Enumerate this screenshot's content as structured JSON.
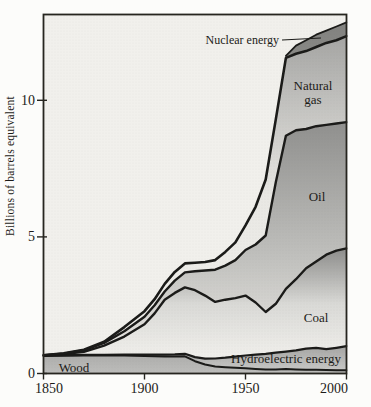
{
  "figure": {
    "background": "#fcfcfa",
    "plot_background": "#f1f0ec",
    "line_color": "#1b1b19"
  },
  "chart_data": {
    "type": "area",
    "stacked": true,
    "title": "",
    "xlabel": "",
    "ylabel": "Billions of barrels equivalent",
    "xlim": [
      1850,
      2000
    ],
    "ylim": [
      0,
      13.14
    ],
    "x_ticks": [
      1850,
      1900,
      1950,
      2000
    ],
    "y_ticks": [
      0,
      5,
      10
    ],
    "grid": false,
    "legend_position": "labels-inside-areas",
    "x": [
      1850,
      1860,
      1870,
      1880,
      1890,
      1900,
      1905,
      1910,
      1915,
      1920,
      1925,
      1930,
      1935,
      1940,
      1945,
      1950,
      1955,
      1960,
      1965,
      1970,
      1975,
      1980,
      1985,
      1990,
      1995,
      2000
    ],
    "series": [
      {
        "name": "wood",
        "label": "Wood",
        "values": [
          0.64,
          0.65,
          0.66,
          0.66,
          0.66,
          0.64,
          0.63,
          0.62,
          0.62,
          0.63,
          0.45,
          0.33,
          0.26,
          0.23,
          0.21,
          0.19,
          0.17,
          0.15,
          0.15,
          0.16,
          0.15,
          0.14,
          0.14,
          0.13,
          0.12,
          0.12
        ],
        "gradient": [
          [
            0,
            "#aeaeac"
          ],
          [
            1,
            "#bdbdbb"
          ]
        ],
        "label_pos": [
          74,
          372
        ],
        "line_width": 2.0
      },
      {
        "name": "hydroelectric",
        "label": "Hydroelectric energy",
        "values": [
          0.02,
          0.02,
          0.02,
          0.02,
          0.03,
          0.05,
          0.06,
          0.07,
          0.08,
          0.09,
          0.15,
          0.21,
          0.29,
          0.35,
          0.41,
          0.47,
          0.52,
          0.57,
          0.61,
          0.64,
          0.7,
          0.77,
          0.8,
          0.76,
          0.82,
          0.88
        ],
        "gradient": [
          [
            0,
            "#a5a5a3"
          ],
          [
            1,
            "#c8c8c6"
          ]
        ],
        "label_pos": [
          286,
          363
        ],
        "line_width": 2.2
      },
      {
        "name": "coal",
        "label": "Coal",
        "values": [
          0.0,
          0.04,
          0.11,
          0.34,
          0.66,
          1.11,
          1.51,
          2.01,
          2.25,
          2.43,
          2.45,
          2.31,
          2.07,
          2.12,
          2.14,
          2.19,
          1.91,
          1.53,
          1.79,
          2.3,
          2.6,
          2.94,
          3.16,
          3.46,
          3.56,
          3.58
        ],
        "gradient": [
          [
            0,
            "#8d8d8b"
          ],
          [
            0.5,
            "#d9d9d6"
          ],
          [
            1,
            "#f1f0ec"
          ]
        ],
        "label_pos": [
          316,
          322
        ],
        "line_width": 2.4
      },
      {
        "name": "oil",
        "label": "Oil",
        "values": [
          0.01,
          0.02,
          0.06,
          0.1,
          0.2,
          0.28,
          0.3,
          0.3,
          0.45,
          0.55,
          0.69,
          0.92,
          1.18,
          1.25,
          1.39,
          1.67,
          2.12,
          2.8,
          4.45,
          5.6,
          5.45,
          5.1,
          4.95,
          4.75,
          4.65,
          4.62
        ],
        "gradient": [
          [
            0,
            "#90908e"
          ],
          [
            0.6,
            "#c2c2bf"
          ],
          [
            1,
            "#eae8e4"
          ]
        ],
        "label_pos": [
          317,
          201
        ],
        "line_width": 2.4
      },
      {
        "name": "natural-gas",
        "label": "Natural gas",
        "label_lines": [
          "Natural",
          "gas"
        ],
        "values": [
          0.0,
          0.01,
          0.02,
          0.04,
          0.15,
          0.2,
          0.22,
          0.28,
          0.32,
          0.33,
          0.31,
          0.31,
          0.35,
          0.5,
          0.65,
          0.9,
          1.38,
          2.05,
          2.3,
          2.85,
          2.8,
          2.85,
          2.9,
          3.0,
          3.05,
          3.15
        ],
        "gradient": [
          [
            0,
            "#a5a5a3"
          ],
          [
            0.5,
            "#e9e8e4"
          ],
          [
            1,
            "#f1f0ec"
          ]
        ],
        "label_pos": [
          313,
          90
        ],
        "line_width": 2.6
      },
      {
        "name": "nuclear",
        "label": "Nuclear energy",
        "values": [
          0,
          0,
          0,
          0,
          0,
          0,
          0,
          0,
          0,
          0,
          0,
          0,
          0,
          0,
          0,
          0,
          0,
          0,
          0,
          0.08,
          0.3,
          0.4,
          0.45,
          0.45,
          0.5,
          0.5
        ],
        "gradient": [
          [
            0,
            "#82827f"
          ],
          [
            1,
            "#c4c4c2"
          ]
        ],
        "line_from": 1970,
        "line_width": 1.8,
        "label_outside": true
      }
    ],
    "annotation": {
      "text": "Nuclear energy",
      "text_anchor": [
        279,
        44
      ],
      "leader": [
        [
          282,
          40
        ],
        [
          321,
          38
        ]
      ]
    }
  }
}
